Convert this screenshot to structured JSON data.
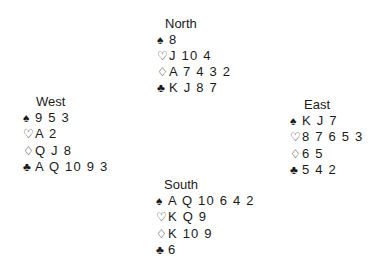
{
  "suits": {
    "spades": "♠",
    "hearts": "♡",
    "diamonds": "♢",
    "clubs": "♣"
  },
  "hands": {
    "north": {
      "name": "North",
      "spades": "8",
      "hearts": "J 10 4",
      "diamonds": "A 7 4 3 2",
      "clubs": "K J 8 7"
    },
    "west": {
      "name": "West",
      "spades": "9 5 3",
      "hearts": "A 2",
      "diamonds": "Q J 8",
      "clubs": "A Q 10 9 3"
    },
    "east": {
      "name": "East",
      "spades": "K J 7",
      "hearts": "8 7 6 5 3",
      "diamonds": "6 5",
      "clubs": "5 4 2"
    },
    "south": {
      "name": "South",
      "spades": "A Q 10 6 4 2",
      "hearts": "K Q 9",
      "diamonds": "K 10 9",
      "clubs": "6"
    }
  }
}
